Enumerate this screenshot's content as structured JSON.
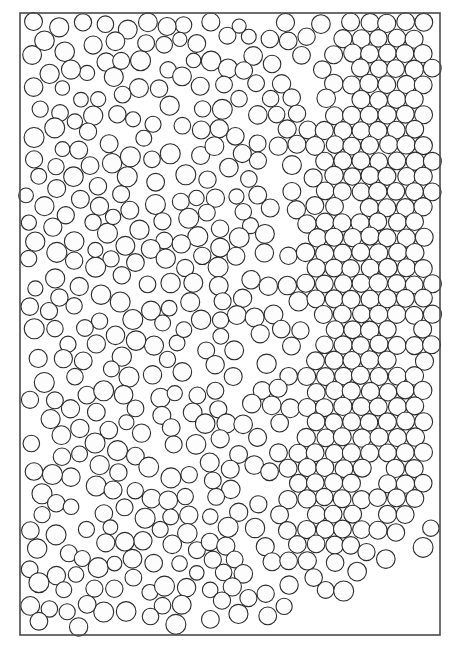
{
  "figure": {
    "kind": "scientific-figure",
    "description": "Dense 2D disk packing showing an amorphous (disordered) region on the left and a hexagonally ordered crystalline region on the right, with a sloped free surface and scattered loose disks in the lower right",
    "caption": "",
    "title": "",
    "axis_labels": [],
    "tick_labels": [],
    "legend_entries": [],
    "annotations": []
  },
  "canvas": {
    "width": 459,
    "height": 653,
    "background_color": "#ffffff",
    "margin_color": "#ffffff"
  },
  "container": {
    "name": "rectangular-cell-border",
    "x": 20,
    "y": 13,
    "width": 420,
    "height": 622,
    "stroke_color": "#4a4a4a",
    "stroke_width": 1.6,
    "fill": "#ffffff"
  },
  "disks": {
    "stroke_color": "#2b2b2b",
    "stroke_width": 1.1,
    "fill_color": "#fdfdfd",
    "nominal_diameter_px": 18,
    "diameter_min_px": 14,
    "diameter_max_px": 20,
    "approx_count": 980,
    "packing_note": "contacting disks, near jamming"
  },
  "regions": [
    {
      "id": "amorphous-region",
      "label": "disordered / amorphous packing",
      "location": "left",
      "lattice": "none",
      "polydispersity": "moderate"
    },
    {
      "id": "crystalline-region",
      "label": "hexagonal close packed crystal",
      "location": "right",
      "lattice": "triangular",
      "polydispersity": "low"
    },
    {
      "id": "free-surface-region",
      "label": "empty region below sloped free surface",
      "location": "bottom-right",
      "lattice": "none",
      "polydispersity": "none"
    }
  ],
  "free_surface": {
    "name": "sloped-free-surface",
    "description": "downward-left sloping boundary of the packing in the lower portion of the cell",
    "points": [
      [
        440,
        500
      ],
      [
        400,
        520
      ],
      [
        360,
        545
      ],
      [
        320,
        560
      ],
      [
        280,
        575
      ],
      [
        240,
        590
      ],
      [
        200,
        605
      ],
      [
        160,
        618
      ],
      [
        120,
        628
      ],
      [
        80,
        634
      ],
      [
        20,
        635
      ]
    ]
  },
  "seed": 20240517
}
